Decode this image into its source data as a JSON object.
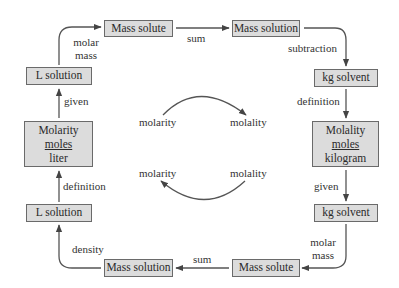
{
  "diagram": {
    "type": "conversion-cycle",
    "nodes": {
      "mass_solute_top": "Mass solute",
      "mass_solution_top": "Mass solution",
      "kg_solvent_top": "kg solvent",
      "molality": {
        "title": "Molality",
        "numerator": "moles",
        "denominator": "kilogram"
      },
      "kg_solvent_bottom": "kg solvent",
      "mass_solute_bottom": "Mass solute",
      "mass_solution_bottom": "Mass solution",
      "l_solution_bottom": "L solution",
      "molarity": {
        "title": "Molarity",
        "numerator": "moles",
        "denominator": "liter"
      },
      "l_solution_top": "L solution"
    },
    "edges": {
      "l_to_mass_solute": {
        "line1": "molar",
        "line2": "mass"
      },
      "mass_solute_to_mass_solution": "sum",
      "mass_solution_to_kg_solvent": "subtraction",
      "kg_solvent_to_molality": "definition",
      "molality_to_kg_solvent": "given",
      "kg_solvent_to_mass_solute": {
        "line1": "molar",
        "line2": "mass"
      },
      "mass_solution_to_l_solution": "density",
      "l_solution_to_molarity": "definition",
      "molarity_to_l_solution": "given"
    },
    "center": {
      "top_left": "molarity",
      "top_right": "molality",
      "bottom_left": "molarity",
      "bottom_right": "molality"
    }
  }
}
